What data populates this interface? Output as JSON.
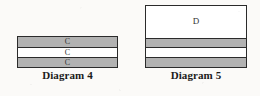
{
  "page": {
    "background_color": "#fbfaf8",
    "ink_color": "#2b2b2b",
    "shade_color": "#b2b2b2",
    "unshaded_color": "#ffffff"
  },
  "figures": [
    {
      "id": "diagram-4",
      "caption": "Diagram 4",
      "band_count": 3,
      "bands": [
        {
          "label": "C",
          "fill": "shaded",
          "height_fraction": 0.34
        },
        {
          "label": "C",
          "fill": "plain",
          "height_fraction": 0.33
        },
        {
          "label": "C",
          "fill": "shaded",
          "height_fraction": 0.33
        }
      ]
    },
    {
      "id": "diagram-5",
      "caption": "Diagram 5",
      "band_count": 4,
      "bands": [
        {
          "label": "D",
          "fill": "plain",
          "height_fraction": 0.52
        },
        {
          "label": "",
          "fill": "shaded",
          "height_fraction": 0.16
        },
        {
          "label": "",
          "fill": "plain",
          "height_fraction": 0.16
        },
        {
          "label": "",
          "fill": "shaded",
          "height_fraction": 0.16
        }
      ]
    }
  ]
}
